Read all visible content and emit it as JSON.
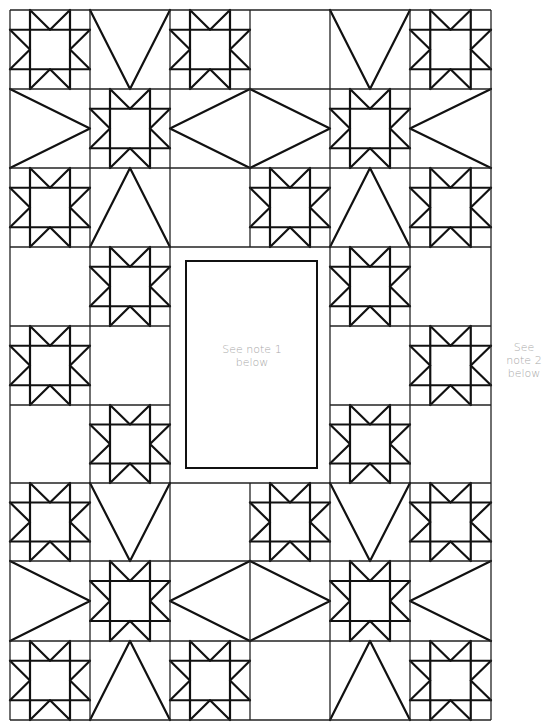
{
  "diagram": {
    "grid": {
      "columns": 6,
      "rows": 9,
      "col_edges": [
        10,
        90,
        170,
        250,
        330,
        410,
        491
      ],
      "row_edges": [
        10,
        89,
        168,
        247,
        326,
        405,
        483,
        561,
        641,
        720
      ]
    },
    "cell_types": {
      "star": "Sawtooth star block",
      "v": "Triangle pointing down",
      "up": "Triangle pointing up",
      "right": "Triangle pointing right",
      "left": "Triangle pointing left",
      "dl": "Half-diamond (left half)",
      "dr": "Half-diamond (right half)",
      "empty": "Plain square",
      "center": "Center panel"
    },
    "layout": [
      [
        "star",
        "v",
        "star",
        "empty",
        "v",
        "star"
      ],
      [
        "right",
        "star",
        "dl",
        "dr",
        "star",
        "left"
      ],
      [
        "star",
        "up",
        "empty",
        "star",
        "up",
        "star"
      ],
      [
        "empty",
        "star",
        "center",
        "center",
        "star",
        "empty"
      ],
      [
        "star",
        "empty",
        "center",
        "center",
        "empty",
        "star"
      ],
      [
        "empty",
        "star",
        "center",
        "center",
        "star",
        "empty"
      ],
      [
        "star",
        "v",
        "empty",
        "star",
        "v",
        "star"
      ],
      [
        "right",
        "star",
        "dl",
        "dr",
        "star",
        "left"
      ],
      [
        "star",
        "up",
        "star",
        "empty",
        "up",
        "star"
      ]
    ],
    "center_panel": {
      "x": 185,
      "y": 260,
      "width": 133,
      "height": 209
    },
    "notes": {
      "note1_line1": "See note 1",
      "note1_line2": "below",
      "note2_line1": "See",
      "note2_line2": "note 2",
      "note2_line3": "below"
    },
    "colors": {
      "line": "#111111",
      "note_text": "#a8a8a8",
      "background": "#ffffff"
    }
  }
}
